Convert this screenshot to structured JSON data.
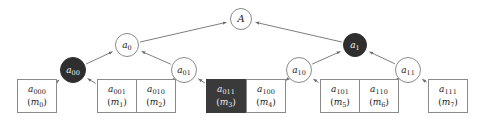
{
  "figure": {
    "width": 480,
    "height": 118,
    "background": "#ffffff",
    "edge_color": "#6e6e6e",
    "node_stroke": "#8a8a8a",
    "highlight_fill": "#2e2e2e",
    "highlight_box_fill": "#3a3a3a",
    "text_color": "#1a1a1a",
    "highlight_text_color": "#f2f2f2"
  },
  "nodes": {
    "root": {
      "id": "A",
      "label": "A",
      "sub": "",
      "shape": "circle",
      "filled": false,
      "cx": 241,
      "cy": 19,
      "r": 11
    },
    "level1": [
      {
        "id": "a_0",
        "label": "a",
        "sub": "0",
        "shape": "circle",
        "filled": false,
        "cx": 127,
        "cy": 45,
        "r": 12
      },
      {
        "id": "a_1",
        "label": "a",
        "sub": "1",
        "shape": "circle",
        "filled": true,
        "cx": 355,
        "cy": 45,
        "r": 12
      }
    ],
    "level2": [
      {
        "id": "a_00",
        "label": "a",
        "sub": "00",
        "shape": "circle",
        "filled": true,
        "cx": 73,
        "cy": 70,
        "r": 13
      },
      {
        "id": "a_01",
        "label": "a",
        "sub": "01",
        "shape": "circle",
        "filled": false,
        "cx": 184,
        "cy": 70,
        "r": 13
      },
      {
        "id": "a_10",
        "label": "a",
        "sub": "10",
        "shape": "circle",
        "filled": false,
        "cx": 299,
        "cy": 70,
        "r": 13
      },
      {
        "id": "a_11",
        "label": "a",
        "sub": "11",
        "shape": "circle",
        "filled": false,
        "cx": 408,
        "cy": 70,
        "r": 13
      }
    ],
    "leaves": [
      {
        "id": "a_000",
        "label": "a",
        "sub": "000",
        "msg": "m",
        "msg_sub": "0",
        "shape": "box",
        "filled": false,
        "x": 17,
        "y": 79,
        "w": 40,
        "h": 34
      },
      {
        "id": "a_001",
        "label": "a",
        "sub": "001",
        "msg": "m",
        "msg_sub": "1",
        "shape": "box",
        "filled": false,
        "x": 97,
        "y": 79,
        "w": 40,
        "h": 34
      },
      {
        "id": "a_010",
        "label": "a",
        "sub": "010",
        "msg": "m",
        "msg_sub": "2",
        "shape": "box",
        "filled": false,
        "x": 136,
        "y": 79,
        "w": 40,
        "h": 34
      },
      {
        "id": "a_011",
        "label": "a",
        "sub": "011",
        "msg": "m",
        "msg_sub": "3",
        "shape": "box",
        "filled": true,
        "x": 206,
        "y": 79,
        "w": 40,
        "h": 34
      },
      {
        "id": "a_100",
        "label": "a",
        "sub": "100",
        "msg": "m",
        "msg_sub": "4",
        "shape": "box",
        "filled": false,
        "x": 246,
        "y": 79,
        "w": 40,
        "h": 34
      },
      {
        "id": "a_101",
        "label": "a",
        "sub": "101",
        "msg": "m",
        "msg_sub": "5",
        "shape": "box",
        "filled": false,
        "x": 320,
        "y": 79,
        "w": 40,
        "h": 34
      },
      {
        "id": "a_110",
        "label": "a",
        "sub": "110",
        "msg": "m",
        "msg_sub": "6",
        "shape": "box",
        "filled": false,
        "x": 359,
        "y": 79,
        "w": 40,
        "h": 34
      },
      {
        "id": "a_111",
        "label": "a",
        "sub": "111",
        "msg": "m",
        "msg_sub": "7",
        "shape": "box",
        "filled": false,
        "x": 428,
        "y": 79,
        "w": 40,
        "h": 34
      }
    ]
  },
  "edges": [
    {
      "from": "a_0",
      "to": "A"
    },
    {
      "from": "a_1",
      "to": "A"
    },
    {
      "from": "a_00",
      "to": "a_0"
    },
    {
      "from": "a_01",
      "to": "a_0"
    },
    {
      "from": "a_10",
      "to": "a_1"
    },
    {
      "from": "a_11",
      "to": "a_1"
    },
    {
      "from": "a_000",
      "to": "a_00"
    },
    {
      "from": "a_001",
      "to": "a_00"
    },
    {
      "from": "a_010",
      "to": "a_01"
    },
    {
      "from": "a_011",
      "to": "a_01"
    },
    {
      "from": "a_100",
      "to": "a_10"
    },
    {
      "from": "a_101",
      "to": "a_10"
    },
    {
      "from": "a_110",
      "to": "a_11"
    },
    {
      "from": "a_111",
      "to": "a_11"
    }
  ]
}
